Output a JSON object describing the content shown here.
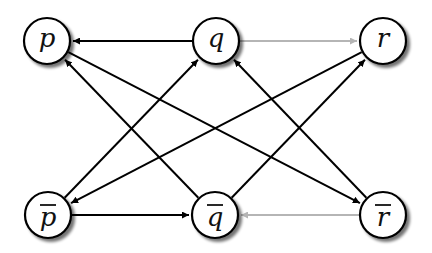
{
  "diagram": {
    "type": "directed-graph",
    "colors": {
      "edge": "#000000",
      "edge_light": "#b5b5b5",
      "node_fill": "#ffffff",
      "node_stroke": "#000000",
      "shadow": "#9a9a9a"
    },
    "node_radius": 23,
    "nodes": [
      {
        "id": "p",
        "label": "p",
        "negated": false,
        "x": 47,
        "y": 41
      },
      {
        "id": "q",
        "label": "q",
        "negated": false,
        "x": 216,
        "y": 41
      },
      {
        "id": "r",
        "label": "r",
        "negated": false,
        "x": 383,
        "y": 41
      },
      {
        "id": "pbar",
        "label": "p",
        "negated": true,
        "x": 48,
        "y": 215
      },
      {
        "id": "qbar",
        "label": "q",
        "negated": true,
        "x": 215,
        "y": 215
      },
      {
        "id": "rbar",
        "label": "r",
        "negated": true,
        "x": 383,
        "y": 215
      }
    ],
    "edges": [
      {
        "from": "q",
        "to": "p",
        "style": "dark"
      },
      {
        "from": "q",
        "to": "r",
        "style": "light"
      },
      {
        "from": "pbar",
        "to": "qbar",
        "style": "dark"
      },
      {
        "from": "rbar",
        "to": "qbar",
        "style": "light"
      },
      {
        "from": "p",
        "to": "rbar",
        "style": "dark"
      },
      {
        "from": "qbar",
        "to": "p",
        "style": "dark"
      },
      {
        "from": "pbar",
        "to": "q",
        "style": "dark"
      },
      {
        "from": "r",
        "to": "pbar",
        "style": "dark"
      },
      {
        "from": "rbar",
        "to": "q",
        "style": "dark"
      },
      {
        "from": "qbar",
        "to": "r",
        "style": "dark"
      }
    ]
  }
}
